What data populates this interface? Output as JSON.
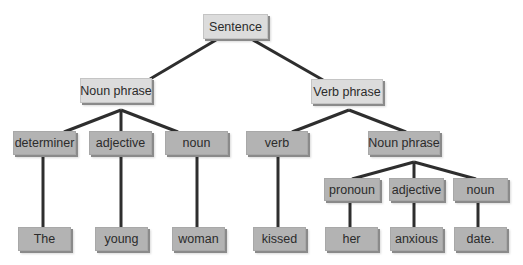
{
  "diagram": {
    "type": "parse-tree",
    "colors": {
      "line": "#2e2e2e",
      "light_box": "#dcdcdc",
      "dark_box": "#b3b3b3"
    },
    "nodes": [
      {
        "id": "s",
        "label": "Sentence",
        "x": 203,
        "y": 14,
        "w": 65,
        "h": 25,
        "style": "light"
      },
      {
        "id": "np1",
        "label": "Noun phrase",
        "x": 80,
        "y": 78,
        "w": 72,
        "h": 25,
        "style": "light"
      },
      {
        "id": "vp",
        "label": "Verb phrase",
        "x": 311,
        "y": 79,
        "w": 72,
        "h": 25,
        "style": "light"
      },
      {
        "id": "det",
        "label": "determiner",
        "x": 13,
        "y": 131,
        "w": 63,
        "h": 24,
        "style": "dark"
      },
      {
        "id": "adj1",
        "label": "adjective",
        "x": 89,
        "y": 131,
        "w": 63,
        "h": 24,
        "style": "dark"
      },
      {
        "id": "n1",
        "label": "noun",
        "x": 165,
        "y": 131,
        "w": 63,
        "h": 24,
        "style": "dark"
      },
      {
        "id": "v",
        "label": "verb",
        "x": 246,
        "y": 131,
        "w": 62,
        "h": 24,
        "style": "dark"
      },
      {
        "id": "np2",
        "label": "Noun phrase",
        "x": 368,
        "y": 131,
        "w": 72,
        "h": 24,
        "style": "dark"
      },
      {
        "id": "pro",
        "label": "pronoun",
        "x": 324,
        "y": 178,
        "w": 56,
        "h": 23,
        "style": "dark"
      },
      {
        "id": "adj2",
        "label": "adjective",
        "x": 389,
        "y": 178,
        "w": 55,
        "h": 23,
        "style": "dark"
      },
      {
        "id": "n2",
        "label": "noun",
        "x": 453,
        "y": 178,
        "w": 55,
        "h": 23,
        "style": "dark"
      },
      {
        "id": "w1",
        "label": "The",
        "x": 18,
        "y": 227,
        "w": 53,
        "h": 24,
        "style": "dark"
      },
      {
        "id": "w2",
        "label": "young",
        "x": 95,
        "y": 227,
        "w": 53,
        "h": 24,
        "style": "dark"
      },
      {
        "id": "w3",
        "label": "woman",
        "x": 172,
        "y": 227,
        "w": 53,
        "h": 24,
        "style": "dark"
      },
      {
        "id": "w4",
        "label": "kissed",
        "x": 253,
        "y": 227,
        "w": 53,
        "h": 24,
        "style": "dark"
      },
      {
        "id": "w5",
        "label": "her",
        "x": 325,
        "y": 227,
        "w": 53,
        "h": 24,
        "style": "dark"
      },
      {
        "id": "w6",
        "label": "anxious",
        "x": 390,
        "y": 227,
        "w": 53,
        "h": 24,
        "style": "dark"
      },
      {
        "id": "w7",
        "label": "date.",
        "x": 454,
        "y": 227,
        "w": 53,
        "h": 24,
        "style": "dark"
      }
    ],
    "edges": [
      {
        "from": "s",
        "to": "np1",
        "x1": 216,
        "y1": 40,
        "x2": 150,
        "y2": 79
      },
      {
        "from": "s",
        "to": "vp",
        "x1": 253,
        "y1": 40,
        "x2": 323,
        "y2": 80
      },
      {
        "from": "np1",
        "to": "det",
        "x1": 121,
        "y1": 110,
        "x2": 64,
        "y2": 132
      },
      {
        "from": "np1",
        "to": "adj1",
        "x1": 121,
        "y1": 110,
        "x2": 121,
        "y2": 132
      },
      {
        "from": "np1",
        "to": "n1",
        "x1": 121,
        "y1": 110,
        "x2": 178,
        "y2": 132
      },
      {
        "from": "vp",
        "to": "v",
        "x1": 349,
        "y1": 110,
        "x2": 292,
        "y2": 132
      },
      {
        "from": "vp",
        "to": "np2",
        "x1": 349,
        "y1": 110,
        "x2": 406,
        "y2": 132
      },
      {
        "from": "np2",
        "to": "pro",
        "x1": 414,
        "y1": 162,
        "x2": 352,
        "y2": 179
      },
      {
        "from": "np2",
        "to": "adj2",
        "x1": 414,
        "y1": 162,
        "x2": 414,
        "y2": 179
      },
      {
        "from": "np2",
        "to": "n2",
        "x1": 414,
        "y1": 162,
        "x2": 476,
        "y2": 179
      },
      {
        "from": "det",
        "to": "w1",
        "x1": 43,
        "y1": 156,
        "x2": 43,
        "y2": 228
      },
      {
        "from": "adj1",
        "to": "w2",
        "x1": 121,
        "y1": 156,
        "x2": 121,
        "y2": 228
      },
      {
        "from": "n1",
        "to": "w3",
        "x1": 197,
        "y1": 156,
        "x2": 197,
        "y2": 228
      },
      {
        "from": "v",
        "to": "w4",
        "x1": 278,
        "y1": 156,
        "x2": 278,
        "y2": 228
      },
      {
        "from": "pro",
        "to": "w5",
        "x1": 350,
        "y1": 202,
        "x2": 350,
        "y2": 228
      },
      {
        "from": "adj2",
        "to": "w6",
        "x1": 414,
        "y1": 202,
        "x2": 414,
        "y2": 228
      },
      {
        "from": "n2",
        "to": "w7",
        "x1": 478,
        "y1": 202,
        "x2": 478,
        "y2": 228
      }
    ]
  }
}
